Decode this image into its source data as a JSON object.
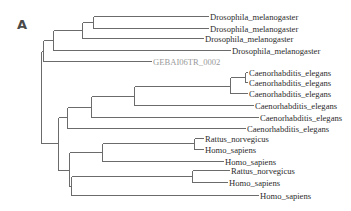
{
  "figure": {
    "panel_label": "A",
    "type": "phylogenetic-tree",
    "colors": {
      "branch": "#6b6b6b",
      "label": "#2c2c2c",
      "highlight_label": "#9a9a9a"
    }
  },
  "leaves": [
    {
      "label": "Drosophila_melanogaster",
      "x": 208,
      "y": 16,
      "style": "normal"
    },
    {
      "label": "Drosophila_melanogaster",
      "x": 208,
      "y": 28,
      "style": "normal"
    },
    {
      "label": "Drosophila_melanogaster",
      "x": 203,
      "y": 38,
      "style": "normal"
    },
    {
      "label": "Drosophila_melanogaster",
      "x": 230,
      "y": 50,
      "style": "normal"
    },
    {
      "label": "GEBAI06TR_0002",
      "x": 151,
      "y": 61,
      "style": "gray"
    },
    {
      "label": "Caenorhabditis_elegans",
      "x": 247,
      "y": 72,
      "style": "normal"
    },
    {
      "label": "Caenorhabditis_elegans",
      "x": 247,
      "y": 82,
      "style": "normal"
    },
    {
      "label": "Caenorhabditis_elegans",
      "x": 247,
      "y": 93,
      "style": "normal"
    },
    {
      "label": "Caenorhabditis_elegans",
      "x": 253,
      "y": 105,
      "style": "normal"
    },
    {
      "label": "Caenorhabditis_elegans",
      "x": 258,
      "y": 117,
      "style": "normal"
    },
    {
      "label": "Caenorhabditis_elegans",
      "x": 245,
      "y": 128,
      "style": "normal"
    },
    {
      "label": "Rattus_norvegicus",
      "x": 203,
      "y": 138,
      "style": "normal"
    },
    {
      "label": "Homo_sapiens",
      "x": 203,
      "y": 149,
      "style": "normal"
    },
    {
      "label": "Homo_sapiens",
      "x": 223,
      "y": 161,
      "style": "normal"
    },
    {
      "label": "Rattus_norvegicus",
      "x": 229,
      "y": 170,
      "style": "normal"
    },
    {
      "label": "Homo_sapiens",
      "x": 227,
      "y": 182,
      "style": "normal"
    },
    {
      "label": "Homo_sapiens",
      "x": 258,
      "y": 195,
      "style": "normal"
    }
  ],
  "nodes": [
    {
      "id": "root",
      "x": 41,
      "y1": 51,
      "y2": 143,
      "parent_x": null
    },
    {
      "id": "dros_geba",
      "x": 43,
      "y1": 40,
      "y2": 61,
      "y": 51,
      "parent_x": 41
    },
    {
      "id": "dros_all",
      "x": 53,
      "y1": 30,
      "y2": 50,
      "y": 40,
      "parent_x": 43
    },
    {
      "id": "dros_3",
      "x": 82,
      "y1": 22,
      "y2": 38,
      "y": 30,
      "parent_x": 53
    },
    {
      "id": "dros_2",
      "x": 93,
      "y1": 16,
      "y2": 28,
      "y": 22,
      "parent_x": 82
    },
    {
      "id": "caeno_mammal",
      "x": 58,
      "y1": 117,
      "y2": 170,
      "y": 143,
      "parent_x": 41
    },
    {
      "id": "caeno_all",
      "x": 67,
      "y1": 107,
      "y2": 128,
      "y": 117,
      "parent_x": 58
    },
    {
      "id": "caeno_5",
      "x": 91,
      "y1": 96,
      "y2": 117,
      "y": 107,
      "parent_x": 67
    },
    {
      "id": "caeno_4",
      "x": 134,
      "y1": 86,
      "y2": 105,
      "y": 96,
      "parent_x": 91
    },
    {
      "id": "caeno_3",
      "x": 230,
      "y1": 77,
      "y2": 93,
      "y": 86,
      "parent_x": 134
    },
    {
      "id": "caeno_2",
      "x": 245,
      "y1": 72,
      "y2": 82,
      "y": 77,
      "parent_x": 230
    },
    {
      "id": "mammal_all",
      "x": 69,
      "y1": 152,
      "y2": 186,
      "y": 170,
      "parent_x": 58
    },
    {
      "id": "mammal_a",
      "x": 102,
      "y1": 143,
      "y2": 161,
      "y": 152,
      "parent_x": 69
    },
    {
      "id": "mammal_a_pair",
      "x": 194,
      "y1": 138,
      "y2": 149,
      "y": 143,
      "parent_x": 102
    },
    {
      "id": "mammal_b",
      "x": 71,
      "y1": 176,
      "y2": 195,
      "y": 186,
      "parent_x": 69
    },
    {
      "id": "mammal_b_pair",
      "x": 192,
      "y1": 170,
      "y2": 182,
      "y": 176,
      "parent_x": 71
    }
  ],
  "leaf_parents": [
    43,
    93,
    82,
    53,
    43,
    245,
    245,
    230,
    134,
    91,
    67,
    194,
    194,
    102,
    192,
    192,
    71
  ],
  "leaf_parent_fix": {
    "0": 93,
    "4": 43,
    "3": 53
  }
}
